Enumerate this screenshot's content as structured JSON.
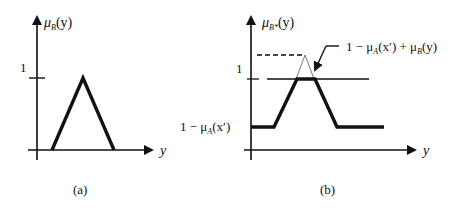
{
  "figure": {
    "panel_a": {
      "caption": "(a)",
      "y_axis_label_mu": "μ",
      "y_axis_label_sub": "B",
      "y_axis_label_arg": "(y)",
      "x_axis_label": "y",
      "tick_one_label": "1",
      "shape": "triangle membership function μB(y), peak at 1"
    },
    "panel_b": {
      "caption": "(b)",
      "y_axis_label_mu": "μ",
      "y_axis_label_sub": "B*",
      "y_axis_label_arg": "(y)",
      "x_axis_label": "y",
      "tick_one_label": "1",
      "floor_label_prefix": "1 − μ",
      "floor_label_sub": "A",
      "floor_label_arg": "(x′)",
      "annotation_prefix": "1 − μ",
      "annotation_sub1": "A",
      "annotation_mid": "(x′) + μ",
      "annotation_sub2": "B",
      "annotation_arg": "(y)",
      "shape": "trapezoid clipped at 1 over floor 1 − μA(x′)"
    },
    "colors": {
      "ink": "#111111",
      "background": "#ffffff"
    }
  }
}
